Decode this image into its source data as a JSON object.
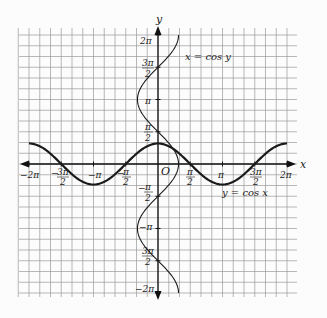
{
  "chart_data": {
    "type": "line",
    "title": "",
    "xlabel": "x",
    "ylabel": "y",
    "origin_label": "O",
    "xlim": [
      "-2π",
      "2π"
    ],
    "ylim": [
      "-2π",
      "2π"
    ],
    "grid": true,
    "x_tick_labels": [
      "-2π",
      "-3π/2",
      "-π",
      "-π/2",
      "π/2",
      "π",
      "3π/2",
      "2π"
    ],
    "y_tick_labels": [
      "2π",
      "3π/2",
      "π",
      "π/2",
      "-π/2",
      "-π",
      "3π/2",
      "-2π"
    ],
    "series": [
      {
        "name": "y = cos x",
        "function": "y = cos(x)",
        "domain": "[-2π, 2π]",
        "style": "bold"
      },
      {
        "name": "x = cos y",
        "function": "x = cos(y)",
        "domain": "[-2π, 2π]",
        "style": "thin"
      }
    ]
  },
  "labels": {
    "x_axis": "x",
    "y_axis": "y",
    "origin": "O",
    "curve1": "y = cos x",
    "curve2": "x = cos y",
    "pi": "π",
    "x_neg2pi": "−2π",
    "x_neg3pi_num": "3π",
    "x_neg3pi_den": "2",
    "x_negpi": "−π",
    "x_negpi2_num": "π",
    "x_negpi2_den": "2",
    "x_pi2_num": "π",
    "x_pi2_den": "2",
    "x_pi": "π",
    "x_3pi2_num": "3π",
    "x_3pi2_den": "2",
    "x_2pi": "2π",
    "y_2pi": "2π",
    "y_3pi2_num": "3π",
    "y_3pi2_den": "2",
    "y_pi": "π",
    "y_pi2_num": "π",
    "y_pi2_den": "2",
    "y_negpi2_num": "π",
    "y_negpi2_den": "2",
    "y_negpi": "−π",
    "y_neg3pi2_num": "3π",
    "y_neg3pi2_den": "2",
    "y_neg2pi": "−2π",
    "minus": "−"
  }
}
